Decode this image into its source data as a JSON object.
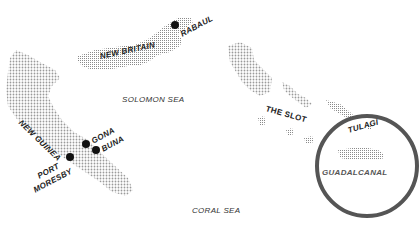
{
  "map": {
    "landmasses": [
      {
        "name": "New Britain"
      },
      {
        "name": "New Guinea"
      },
      {
        "name": "Solomon Islands"
      },
      {
        "name": "Guadalcanal"
      }
    ],
    "labels": {
      "new_britain": "NEW BRITAIN",
      "rabaul": "RABAUL",
      "new_guinea": "NEW GUINEA",
      "gona": "GONA",
      "buna": "BUNA",
      "port_moresby_1": "PORT",
      "port_moresby_2": "MORESBY",
      "solomon_sea": "SOLOMON SEA",
      "the_slot": "THE SLOT",
      "tulagi": "TULAGI",
      "guadalcanal": "GUADALCANAL",
      "coral_sea": "CORAL SEA"
    },
    "markers": [
      {
        "name": "Rabaul",
        "x": 175,
        "y": 25
      },
      {
        "name": "Gona",
        "x": 86,
        "y": 144
      },
      {
        "name": "Buna",
        "x": 96,
        "y": 150
      },
      {
        "name": "Port Moresby",
        "x": 70,
        "y": 157
      }
    ],
    "highlight_circle": {
      "cx": 367,
      "cy": 166,
      "r": 50,
      "color": "#555555"
    }
  }
}
